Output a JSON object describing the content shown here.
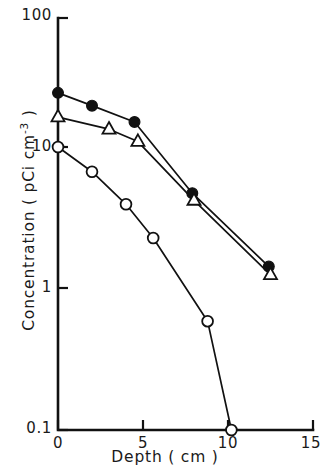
{
  "figure": {
    "background_color": "#ffffff",
    "ink_color": "#111111"
  },
  "axes": {
    "x_title": "Depth ( cm )",
    "y_title_main": "Concentration ( pCi cm",
    "y_title_exponent": "-3",
    "y_title_close": " )",
    "x_ticks": [
      "0",
      "5",
      "10",
      "15"
    ],
    "y_ticks": [
      "100",
      "10",
      "1",
      "0.1"
    ]
  },
  "chart_data": {
    "type": "line",
    "title": "",
    "subtitle": "",
    "xlabel": "Depth ( cm )",
    "ylabel": "Concentration ( pCi cm^-3 )",
    "xlim": [
      0,
      15
    ],
    "ylim": [
      0.1,
      100
    ],
    "yscale": "log",
    "xscale": "linear",
    "grid": false,
    "legend": "none",
    "xticks": [
      0,
      5,
      10,
      15
    ],
    "yticks": [
      0.1,
      1,
      10,
      100
    ],
    "series": [
      {
        "name": "filled-circle-series",
        "marker": "filled-circle",
        "points": [
          {
            "x": 0.0,
            "y": 28.5
          },
          {
            "x": 2.0,
            "y": 23.0
          },
          {
            "x": 4.5,
            "y": 17.5
          },
          {
            "x": 7.9,
            "y": 5.3
          },
          {
            "x": 12.4,
            "y": 1.55
          }
        ]
      },
      {
        "name": "open-triangle-series",
        "marker": "open-triangle",
        "points": [
          {
            "x": 0.0,
            "y": 19.0
          },
          {
            "x": 3.0,
            "y": 15.5
          },
          {
            "x": 4.7,
            "y": 12.6
          },
          {
            "x": 8.0,
            "y": 4.7
          },
          {
            "x": 12.5,
            "y": 1.35
          }
        ]
      },
      {
        "name": "open-circle-series",
        "marker": "open-circle",
        "points": [
          {
            "x": 0.0,
            "y": 11.5
          },
          {
            "x": 2.0,
            "y": 7.6
          },
          {
            "x": 4.0,
            "y": 4.4
          },
          {
            "x": 5.6,
            "y": 2.5
          },
          {
            "x": 8.8,
            "y": 0.62
          },
          {
            "x": 10.2,
            "y": 0.1
          }
        ]
      }
    ]
  }
}
